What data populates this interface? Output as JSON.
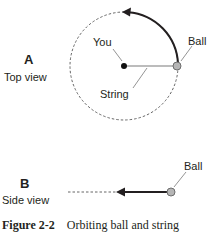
{
  "panel_a": {
    "letter": "A",
    "caption": "Top view",
    "labels": {
      "you": "You",
      "ball": "Ball",
      "string": "String"
    }
  },
  "panel_b": {
    "letter": "B",
    "caption": "Side view",
    "labels": {
      "ball": "Ball"
    }
  },
  "figure_caption": {
    "number": "Figure 2-2",
    "text": "Orbiting ball and string"
  },
  "colors": {
    "line": "#231f20",
    "string": "#7a7a7a",
    "dashed": "#555555",
    "ball_fill": "#b5b5b5",
    "ball_stroke": "#6d6d6d"
  }
}
